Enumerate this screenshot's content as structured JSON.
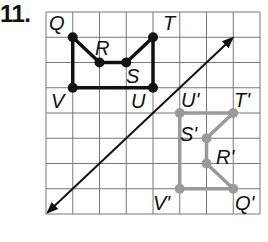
{
  "problem_number": "11.",
  "grid": {
    "cols": 8,
    "rows": 8,
    "left": 46,
    "top": 12,
    "cell_w": 26.75,
    "cell_h": 25.25,
    "line_color": "#777777"
  },
  "reflection_line": {
    "from": [
      0,
      8
    ],
    "to": [
      7,
      1
    ],
    "color": "#111111"
  },
  "original": {
    "color": "#111111",
    "vertices": [
      {
        "name": "Q",
        "label": "Q",
        "pt": [
          1,
          1
        ]
      },
      {
        "name": "R",
        "label": "R",
        "pt": [
          2,
          2
        ]
      },
      {
        "name": "S",
        "label": "S",
        "pt": [
          3,
          2
        ]
      },
      {
        "name": "T",
        "label": "T",
        "pt": [
          4,
          1
        ]
      },
      {
        "name": "U",
        "label": "U",
        "pt": [
          4,
          3
        ]
      },
      {
        "name": "V",
        "label": "V",
        "pt": [
          1,
          3
        ]
      }
    ]
  },
  "image": {
    "color": "#9a9a9a",
    "vertices": [
      {
        "name": "Q-prime",
        "label": "Q'",
        "pt": [
          7,
          7
        ]
      },
      {
        "name": "R-prime",
        "label": "R'",
        "pt": [
          6,
          6
        ]
      },
      {
        "name": "S-prime",
        "label": "S'",
        "pt": [
          6,
          5
        ]
      },
      {
        "name": "T-prime",
        "label": "T'",
        "pt": [
          7,
          4
        ]
      },
      {
        "name": "U-prime",
        "label": "U'",
        "pt": [
          5,
          4
        ]
      },
      {
        "name": "V-prime",
        "label": "V'",
        "pt": [
          5,
          7
        ]
      }
    ]
  },
  "labels": {
    "Q": "Q",
    "R": "R",
    "S": "S",
    "T": "T",
    "U": "U",
    "V": "V",
    "Qp": "Q'",
    "Rp": "R'",
    "Sp": "S'",
    "Tp": "T'",
    "Up": "U'",
    "Vp": "V'"
  }
}
